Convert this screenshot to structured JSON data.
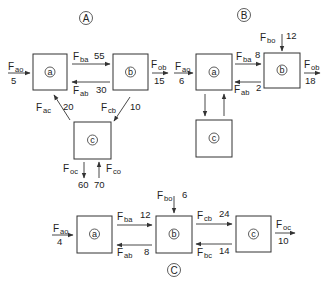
{
  "panels": [
    {
      "id": "A",
      "label": "A",
      "nodes": [
        "a",
        "b",
        "c"
      ],
      "flows": [
        {
          "name": "F",
          "sub": "ao",
          "value": "5",
          "from": "outside",
          "to": "a"
        },
        {
          "name": "F",
          "sub": "ba",
          "value": "55",
          "from": "a",
          "to": "b"
        },
        {
          "name": "F",
          "sub": "ab",
          "value": "30",
          "from": "b",
          "to": "a"
        },
        {
          "name": "F",
          "sub": "ob",
          "value": "15",
          "from": "b",
          "to": "outside"
        },
        {
          "name": "F",
          "sub": "ac",
          "value": "20",
          "from": "c",
          "to": "a"
        },
        {
          "name": "F",
          "sub": "cb",
          "value": "10",
          "from": "b",
          "to": "c"
        },
        {
          "name": "F",
          "sub": "oc",
          "value": "60",
          "from": "c",
          "to": "outside"
        },
        {
          "name": "F",
          "sub": "co",
          "value": "70",
          "from": "outside",
          "to": "c"
        }
      ]
    },
    {
      "id": "B",
      "label": "B",
      "nodes": [
        "a",
        "b",
        "c"
      ],
      "flows": [
        {
          "name": "F",
          "sub": "ao",
          "value": "6",
          "from": "outside",
          "to": "a"
        },
        {
          "name": "F",
          "sub": "ba",
          "value": "8",
          "from": "a",
          "to": "b"
        },
        {
          "name": "F",
          "sub": "ab",
          "value": "2",
          "from": "b",
          "to": "a"
        },
        {
          "name": "F",
          "sub": "bo",
          "value": "12",
          "from": "outside",
          "to": "b"
        },
        {
          "name": "F",
          "sub": "ob",
          "value": "18",
          "from": "b",
          "to": "outside"
        },
        {
          "name": "",
          "sub": "",
          "value": "",
          "from": "a",
          "to": "c"
        },
        {
          "name": "",
          "sub": "",
          "value": "",
          "from": "c",
          "to": "a"
        }
      ]
    },
    {
      "id": "C",
      "label": "C",
      "nodes": [
        "a",
        "b",
        "c"
      ],
      "flows": [
        {
          "name": "F",
          "sub": "ao",
          "value": "4",
          "from": "outside",
          "to": "a"
        },
        {
          "name": "F",
          "sub": "ba",
          "value": "12",
          "from": "a",
          "to": "b"
        },
        {
          "name": "F",
          "sub": "ab",
          "value": "8",
          "from": "b",
          "to": "a"
        },
        {
          "name": "F",
          "sub": "bo",
          "value": "6",
          "from": "outside",
          "to": "b"
        },
        {
          "name": "F",
          "sub": "cb",
          "value": "24",
          "from": "b",
          "to": "c"
        },
        {
          "name": "F",
          "sub": "bc",
          "value": "14",
          "from": "c",
          "to": "b"
        },
        {
          "name": "F",
          "sub": "oc",
          "value": "10",
          "from": "c",
          "to": "outside"
        }
      ]
    }
  ]
}
